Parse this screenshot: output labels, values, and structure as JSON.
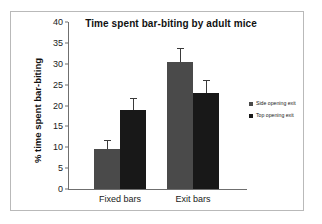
{
  "chart_data": {
    "type": "bar",
    "title": "Time spent bar-biting by adult mice",
    "xlabel": "",
    "ylabel": "% time spent bar-biting",
    "categories": [
      "Fixed bars",
      "Exit bars"
    ],
    "series": [
      {
        "name": "Side opening exit",
        "color": "#4a4a4a",
        "values": [
          9.5,
          30.5
        ],
        "errors_upper": [
          2.0,
          3.0
        ]
      },
      {
        "name": "Top opening exit",
        "color": "#181818",
        "values": [
          19.0,
          23.0
        ],
        "errors_upper": [
          2.5,
          2.9
        ]
      }
    ],
    "ylim": [
      0,
      40
    ],
    "yticks": [
      0,
      5,
      10,
      15,
      20,
      25,
      30,
      35,
      40
    ],
    "ytick_labels": [
      "0",
      "5",
      "10",
      "15",
      "20",
      "25",
      "30",
      "35",
      "40"
    ],
    "grid": false,
    "legend_position": "right",
    "error_bar_style": "upper-only"
  },
  "legend": {
    "items": [
      {
        "label": "Side opening exit",
        "marker": "square-marker-gray"
      },
      {
        "label": "Top opening exit",
        "marker": "square-marker-black"
      }
    ]
  },
  "axis": {
    "y_title": "% time spent bar-biting",
    "ticks": [
      "40",
      "35",
      "30",
      "25",
      "20",
      "15",
      "10",
      "5",
      "0"
    ],
    "category_labels": [
      "Fixed bars",
      "Exit bars"
    ]
  },
  "colors": {
    "series_side": "#4a4a4a",
    "series_top": "#181818",
    "axis": "#6f6f6f",
    "frame": "#b9b9b9",
    "text": "#1a1a1a",
    "background": "#ffffff"
  }
}
